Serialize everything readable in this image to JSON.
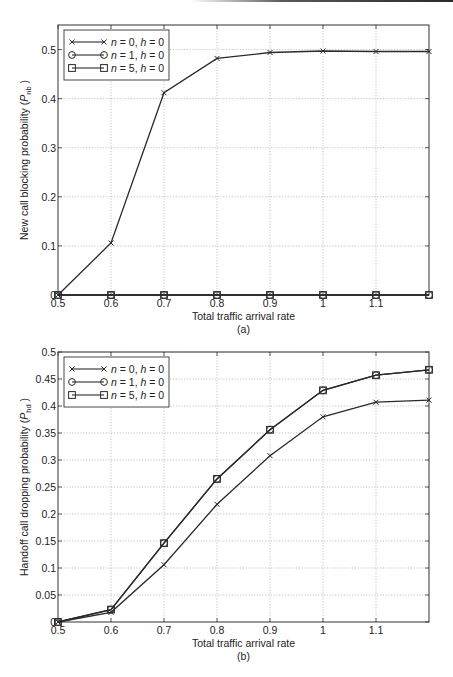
{
  "chart_data": [
    {
      "id": "a",
      "type": "line",
      "title": "",
      "caption": "(a)",
      "xlabel": "Total traffic arrival rate",
      "ylabel": "New call blocking probability (P_nb)",
      "ylabel_main": "New call blocking probability (",
      "ylabel_sym": "P",
      "ylabel_sub": "nb",
      "ylabel_close": " )",
      "xlim": [
        0.5,
        1.2
      ],
      "ylim": [
        0,
        0.55
      ],
      "grid": true,
      "legend_position": "upper left",
      "x_ticks": [
        0.5,
        0.6,
        0.7,
        0.8,
        0.9,
        1.0,
        1.1
      ],
      "x_tick_labels": [
        "0.5",
        "0.6",
        "0.7",
        "0.8",
        "0.9",
        "1",
        "1.1"
      ],
      "y_ticks": [
        0,
        0.1,
        0.2,
        0.3,
        0.4,
        0.5
      ],
      "y_tick_labels": [
        "0",
        "0.1",
        "0.2",
        "0.3",
        "0.4",
        "0.5"
      ],
      "x": [
        0.5,
        0.6,
        0.7,
        0.8,
        0.9,
        1.0,
        1.1,
        1.2
      ],
      "series": [
        {
          "name": "n = 0, h = 0",
          "marker": "x",
          "values": [
            0.0,
            0.106,
            0.412,
            0.482,
            0.494,
            0.497,
            0.496,
            0.496
          ]
        },
        {
          "name": "n = 1, h = 0",
          "marker": "o",
          "values": [
            0.0,
            0.0,
            0.0,
            0.0,
            0.0,
            0.0,
            0.0,
            0.0
          ]
        },
        {
          "name": "n = 5, h = 0",
          "marker": "s",
          "values": [
            0.0,
            0.0,
            0.0,
            0.0,
            0.0,
            0.0,
            0.0,
            0.0
          ]
        }
      ]
    },
    {
      "id": "b",
      "type": "line",
      "title": "",
      "caption": "(b)",
      "xlabel": "Total traffic arrival rate",
      "ylabel": "Handoff call dropping probability (P_hd)",
      "ylabel_main": "Handoff call dropping probability (",
      "ylabel_sym": "P",
      "ylabel_sub": "hd",
      "ylabel_close": " )",
      "xlim": [
        0.5,
        1.2
      ],
      "ylim": [
        0,
        0.5
      ],
      "grid": true,
      "legend_position": "upper left",
      "x_ticks": [
        0.5,
        0.6,
        0.7,
        0.8,
        0.9,
        1.0,
        1.1
      ],
      "x_tick_labels": [
        "0.5",
        "0.6",
        "0.7",
        "0.8",
        "0.9",
        "1",
        "1.1"
      ],
      "y_ticks": [
        0,
        0.05,
        0.1,
        0.15,
        0.2,
        0.25,
        0.3,
        0.35,
        0.4,
        0.45,
        0.5
      ],
      "y_tick_labels": [
        "0",
        "0.05",
        "0.1",
        "0.15",
        "0.2",
        "0.25",
        "0.3",
        "0.35",
        "0.4",
        "0.45",
        "0.5"
      ],
      "x": [
        0.5,
        0.6,
        0.7,
        0.8,
        0.9,
        1.0,
        1.1,
        1.2
      ],
      "series": [
        {
          "name": "n = 0, h = 0",
          "marker": "x",
          "values": [
            0.0,
            0.018,
            0.106,
            0.218,
            0.308,
            0.38,
            0.407,
            0.411
          ]
        },
        {
          "name": "n = 1, h = 0",
          "marker": "o",
          "values": [
            0.0,
            0.023,
            0.146,
            0.265,
            0.356,
            0.429,
            0.457,
            0.467
          ]
        },
        {
          "name": "n = 5, h = 0",
          "marker": "s",
          "values": [
            0.0,
            0.023,
            0.146,
            0.265,
            0.356,
            0.429,
            0.457,
            0.467
          ]
        }
      ]
    }
  ],
  "legend": {
    "entries": [
      {
        "n": "0",
        "h": "0"
      },
      {
        "n": "1",
        "h": "0"
      },
      {
        "n": "5",
        "h": "0"
      }
    ]
  }
}
